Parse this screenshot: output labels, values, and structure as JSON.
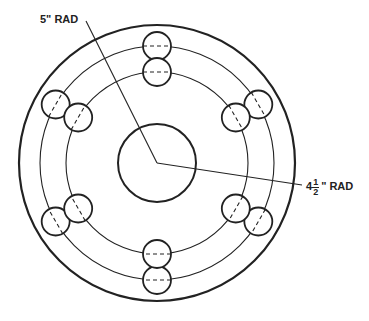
{
  "drawing": {
    "title": "Flange plate with two bolt circles",
    "labels": {
      "outer_radius_label": "5\" RAD",
      "inner_radius_whole": "4",
      "inner_radius_num": "1",
      "inner_radius_den": "2",
      "inner_radius_unit": "\" RAD"
    },
    "center": [
      157,
      163
    ],
    "outer_circle_r": 138,
    "hub_circle_r": 39,
    "bolt_circles": [
      {
        "name": "outer",
        "r": 117,
        "hole_r": 14
      },
      {
        "name": "inner",
        "r": 91,
        "hole_r": 14
      }
    ],
    "hole_angles_deg": [
      90,
      30,
      -30,
      -90,
      -150,
      150
    ]
  }
}
